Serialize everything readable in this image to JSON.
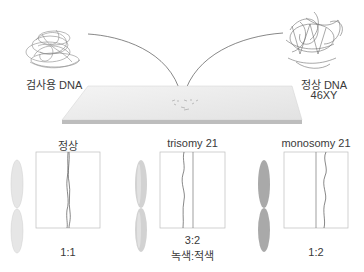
{
  "sources": {
    "test_dna": {
      "label": "검사용 DNA"
    },
    "normal_dna": {
      "label": "정상 DNA",
      "sublabel": "46XY"
    }
  },
  "slide": {
    "name": "microarray-slide"
  },
  "panels": [
    {
      "title": "정상",
      "ratio": "1:1",
      "ratio_note": "",
      "chromosome_color": "#e4e4e4"
    },
    {
      "title": "trisomy 21",
      "ratio": "3:2",
      "ratio_note": "녹색:적색",
      "chromosome_color": "#cfcfcf"
    },
    {
      "title": "monosomy 21",
      "ratio": "1:2",
      "ratio_note": "",
      "chromosome_color": "#a8a8a8"
    }
  ]
}
